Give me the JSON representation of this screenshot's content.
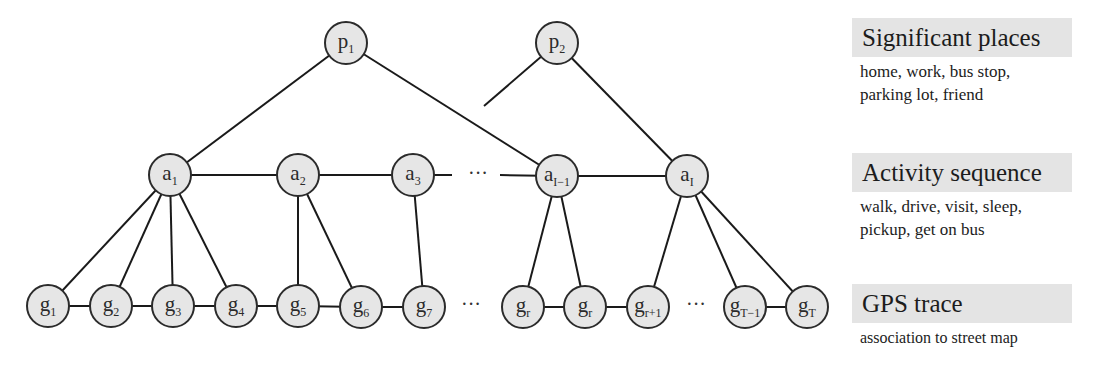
{
  "diagram": {
    "type": "hierarchical-graphical-model",
    "layers": {
      "places": [
        {
          "id": "p1",
          "base": "p",
          "sub": "1",
          "x": 346,
          "y": 43
        },
        {
          "id": "p2",
          "base": "p",
          "sub": "2",
          "x": 557,
          "y": 43
        }
      ],
      "activities": [
        {
          "id": "a1",
          "base": "a",
          "sub": "1",
          "x": 170,
          "y": 175
        },
        {
          "id": "a2",
          "base": "a",
          "sub": "2",
          "x": 298,
          "y": 175
        },
        {
          "id": "a3",
          "base": "a",
          "sub": "3",
          "x": 413,
          "y": 175
        },
        {
          "id": "aI-1",
          "base": "a",
          "sub": "I−1",
          "x": 557,
          "y": 176
        },
        {
          "id": "aI",
          "base": "a",
          "sub": "I",
          "x": 687,
          "y": 176
        }
      ],
      "gps": [
        {
          "id": "g1",
          "base": "g",
          "sub": "1",
          "x": 48,
          "y": 306
        },
        {
          "id": "g2",
          "base": "g",
          "sub": "2",
          "x": 111,
          "y": 306
        },
        {
          "id": "g3",
          "base": "g",
          "sub": "3",
          "x": 173,
          "y": 306
        },
        {
          "id": "g4",
          "base": "g",
          "sub": "4",
          "x": 236,
          "y": 306
        },
        {
          "id": "g5",
          "base": "g",
          "sub": "5",
          "x": 298,
          "y": 306
        },
        {
          "id": "g6",
          "base": "g",
          "sub": "6",
          "x": 361,
          "y": 307
        },
        {
          "id": "g7",
          "base": "g",
          "sub": "7",
          "x": 424,
          "y": 307
        },
        {
          "id": "gr",
          "base": "g",
          "sub": "r",
          "x": 523,
          "y": 307
        },
        {
          "id": "gr2",
          "base": "g",
          "sub": "r",
          "x": 585,
          "y": 307
        },
        {
          "id": "gr+1",
          "base": "g",
          "sub": "r+1",
          "x": 648,
          "y": 307
        },
        {
          "id": "gT-1",
          "base": "g",
          "sub": "T−1",
          "x": 745,
          "y": 307
        },
        {
          "id": "gT",
          "base": "g",
          "sub": "T",
          "x": 807,
          "y": 307
        }
      ]
    },
    "edges": [
      [
        "p1",
        "a1"
      ],
      [
        "p1",
        "aI-1"
      ],
      [
        "p2",
        "aI"
      ],
      [
        "a1",
        "a2"
      ],
      [
        "a2",
        "a3"
      ],
      [
        "aI-1",
        "aI"
      ],
      [
        "a1",
        "g1"
      ],
      [
        "a1",
        "g2"
      ],
      [
        "a1",
        "g3"
      ],
      [
        "a1",
        "g4"
      ],
      [
        "a2",
        "g5"
      ],
      [
        "a2",
        "g6"
      ],
      [
        "a3",
        "g7"
      ],
      [
        "aI-1",
        "gr"
      ],
      [
        "aI-1",
        "gr2"
      ],
      [
        "aI",
        "gr+1"
      ],
      [
        "aI",
        "gT-1"
      ],
      [
        "aI",
        "gT"
      ],
      [
        "g1",
        "g2"
      ],
      [
        "g2",
        "g3"
      ],
      [
        "g3",
        "g4"
      ],
      [
        "g4",
        "g5"
      ],
      [
        "g5",
        "g6"
      ],
      [
        "g6",
        "g7"
      ],
      [
        "gr",
        "gr2"
      ],
      [
        "gr2",
        "gr+1"
      ],
      [
        "gT-1",
        "gT"
      ]
    ],
    "partial_edges": [
      {
        "from": [
          413,
          175
        ],
        "to": [
          452,
          175
        ]
      },
      {
        "from": [
          500,
          175
        ],
        "to": [
          557,
          176
        ]
      },
      {
        "from": [
          557,
          43
        ],
        "to": [
          484,
          106
        ]
      }
    ],
    "ellipses": [
      {
        "x": 478,
        "y": 180,
        "text": "···"
      },
      {
        "x": 471,
        "y": 311,
        "text": "···"
      },
      {
        "x": 696,
        "y": 311,
        "text": "···"
      }
    ],
    "node_radius": 21
  },
  "legend": [
    {
      "title": "Significant places",
      "lines": [
        "home, work, bus stop,",
        "parking lot, friend"
      ]
    },
    {
      "title": "Activity sequence",
      "lines": [
        "walk, drive, visit, sleep,",
        "pickup, get on bus"
      ]
    },
    {
      "title": "GPS trace",
      "lines": [
        "association to street map"
      ]
    }
  ]
}
